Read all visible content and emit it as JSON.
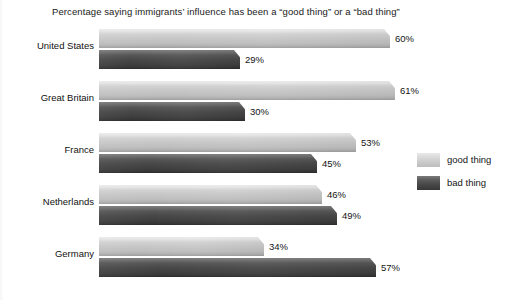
{
  "chart_data": {
    "type": "bar",
    "orientation": "horizontal",
    "title": "Percentage saying immigrants’ influence has been a “good thing” or a “bad thing”",
    "xlabel": "",
    "ylabel": "",
    "xlim": [
      0,
      65
    ],
    "grid": false,
    "legend_position": "right",
    "categories": [
      "United States",
      "Great Britain",
      "France",
      "Netherlands",
      "Germany"
    ],
    "series": [
      {
        "name": "good thing",
        "color": "#c6c6c6",
        "values": [
          60,
          61,
          53,
          46,
          34
        ],
        "labels": [
          "60%",
          "61%",
          "53%",
          "46%",
          "34%"
        ]
      },
      {
        "name": "bad thing",
        "color": "#474747",
        "values": [
          29,
          30,
          45,
          49,
          57
        ],
        "labels": [
          "29%",
          "30%",
          "45%",
          "49%",
          "57%"
        ]
      }
    ]
  },
  "legend": {
    "items": [
      {
        "label": "good thing",
        "swatch": "good"
      },
      {
        "label": "bad thing",
        "swatch": "bad"
      }
    ]
  }
}
